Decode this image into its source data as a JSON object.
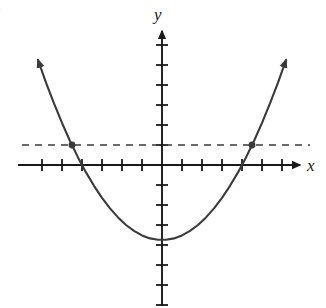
{
  "figure": {
    "part_label": ")",
    "background_color": "#ffffff",
    "ink_color": "#3a3a3a",
    "axis_color": "#1a1a1a",
    "width": 326,
    "height": 308
  },
  "axes": {
    "x_label": "x",
    "y_label": "y",
    "origin_px": {
      "x": 162,
      "y": 165
    },
    "unit_px": 20,
    "x_axis_start_px": 18,
    "x_axis_end_px": 300,
    "y_axis_top_px": 30,
    "y_axis_bottom_px": 306,
    "x_ticks": [
      -6,
      -5,
      -4,
      -3,
      -2,
      -1,
      1,
      2,
      3,
      4,
      5,
      6
    ],
    "y_ticks": [
      -7,
      -6,
      -5,
      -4,
      -3,
      -2,
      -1,
      1,
      2,
      3,
      4,
      5,
      6
    ],
    "tick_half_length_px": 6,
    "arrow_x_positive": true,
    "arrow_y_positive": true,
    "tick_labels_shown": false,
    "grid": false
  },
  "chart_data": {
    "type": "line",
    "title": "",
    "xlabel": "x",
    "ylabel": "y",
    "xlim": [
      -7.2,
      6.9
    ],
    "ylim": [
      -7.05,
      6.75
    ],
    "grid": false,
    "legend": null,
    "series": [
      {
        "name": "parabola",
        "kind": "curve",
        "equation": "y = 0.234*x^2 - 3.75",
        "vertex": [
          0,
          -3.75
        ],
        "roots": [
          -4,
          4
        ],
        "color": "#3a3a3a",
        "style": "solid",
        "arrows": [
          "start",
          "end"
        ],
        "x": [
          -6.2,
          -5.8,
          -5.4,
          -5.0,
          -4.6,
          -4.2,
          -3.8,
          -3.4,
          -3.0,
          -2.6,
          -2.2,
          -1.8,
          -1.4,
          -1.0,
          -0.6,
          -0.2,
          0.2,
          0.6,
          1.0,
          1.4,
          1.8,
          2.2,
          2.6,
          3.0,
          3.4,
          3.8,
          4.2,
          4.6,
          5.0,
          5.4,
          5.8,
          6.2
        ],
        "y": [
          5.25,
          4.12,
          3.08,
          2.11,
          1.2,
          0.38,
          -0.37,
          -1.04,
          -1.64,
          -2.17,
          -2.62,
          -3.0,
          -3.29,
          -3.52,
          -3.67,
          -3.74,
          -3.74,
          -3.67,
          -3.52,
          -3.29,
          -3.0,
          -2.62,
          -2.17,
          -1.64,
          -1.04,
          -0.37,
          0.38,
          1.2,
          2.11,
          3.08,
          4.12,
          5.25
        ]
      },
      {
        "name": "horizontal-dashed-line",
        "kind": "dashed-horizontal",
        "equation": "y = 1",
        "y_value": 1,
        "x_start": -7.0,
        "x_end": 7.4,
        "color": "#3a3a3a",
        "style": "dashed"
      }
    ],
    "points": [
      {
        "name": "left-intersection",
        "x": -4.5,
        "y": 1,
        "marker": "dot",
        "color": "#3a3a3a"
      },
      {
        "name": "right-intersection",
        "x": 4.5,
        "y": 1,
        "marker": "dot",
        "color": "#3a3a3a"
      }
    ],
    "annotations": []
  }
}
